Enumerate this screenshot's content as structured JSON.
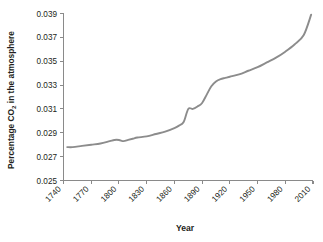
{
  "chart_data": {
    "type": "line",
    "title": "",
    "xlabel": "Year",
    "ylabel": "Percentage CO2 in the atmosphere",
    "ylabel_prefix": "Percentage CO",
    "ylabel_subscript": "2",
    "ylabel_suffix": " in the atmosphere",
    "xlim": [
      1740,
      2010
    ],
    "ylim": [
      0.025,
      0.039
    ],
    "grid": false,
    "legend": false,
    "line_color": "#8c8c8c",
    "axis_color": "#8a8a8a",
    "text_color": "#231f20",
    "background": "#ffffff",
    "xticks": [
      1740,
      1770,
      1800,
      1830,
      1860,
      1890,
      1920,
      1950,
      1980,
      2010
    ],
    "xtick_labels": [
      "1740",
      "1770",
      "1800",
      "1830",
      "1860",
      "1890",
      "1920",
      "1950",
      "1980",
      "2010"
    ],
    "xtick_rotation": 45,
    "yticks": [
      0.025,
      0.027,
      0.029,
      0.031,
      0.033,
      0.035,
      0.037,
      0.039
    ],
    "ytick_labels": [
      "0.025",
      "0.027",
      "0.029",
      "0.031",
      "0.033",
      "0.035",
      "0.037",
      "0.039"
    ],
    "series": [
      {
        "name": "Atmospheric CO2 percentage",
        "x": [
          1744,
          1750,
          1760,
          1770,
          1780,
          1790,
          1795,
          1800,
          1805,
          1810,
          1815,
          1820,
          1830,
          1840,
          1850,
          1860,
          1865,
          1870,
          1875,
          1880,
          1885,
          1890,
          1895,
          1900,
          1905,
          1910,
          1915,
          1920,
          1930,
          1940,
          1950,
          1960,
          1970,
          1980,
          1990,
          2000,
          2008
        ],
        "y": [
          0.0278,
          0.0278,
          0.0279,
          0.028,
          0.0281,
          0.0283,
          0.0284,
          0.0284,
          0.0283,
          0.0284,
          0.0285,
          0.0286,
          0.0287,
          0.0289,
          0.0291,
          0.0294,
          0.0296,
          0.0299,
          0.031,
          0.031,
          0.0312,
          0.0315,
          0.0322,
          0.0329,
          0.0333,
          0.0335,
          0.0336,
          0.0337,
          0.0339,
          0.0342,
          0.0345,
          0.0349,
          0.0353,
          0.0358,
          0.0364,
          0.0372,
          0.0389
        ]
      }
    ]
  }
}
